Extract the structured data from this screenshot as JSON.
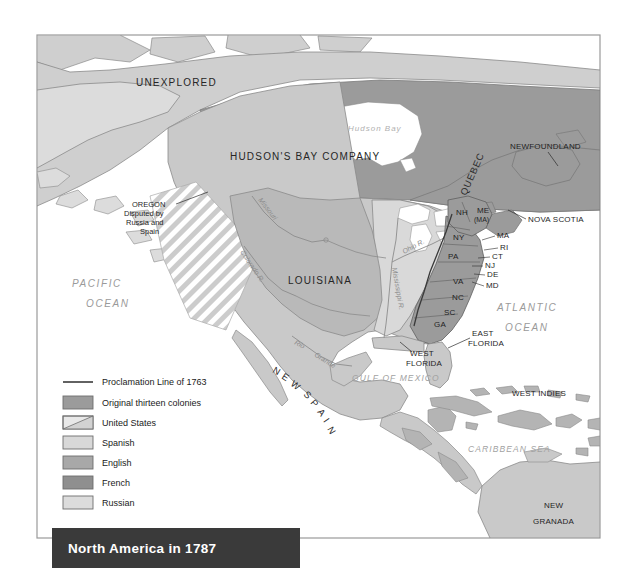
{
  "figure": {
    "title": "North America in 1787",
    "frame": {
      "x": 37,
      "y": 35,
      "width": 563,
      "height": 503
    }
  },
  "colors": {
    "ocean": "#ffffff",
    "page_background": "#ffffff",
    "frame_border": "#9a9a9a",
    "title_bar": "#3a3a3a",
    "title_text": "#ffffff",
    "thirteen_colonies": "#9b9b9b",
    "united_states": "#d9d9d9",
    "spanish": "#c9c9c9",
    "english": "#a8a8a8",
    "french": "#8f8f8f",
    "russian": "#dcdcdc",
    "unexplored": "#cfcfcf",
    "hudsons_bay": "#9b9b9b",
    "proclamation_line": "#3a3a3a",
    "coastline": "#8a8a8a",
    "river": "#8c8c8c"
  },
  "legend": {
    "items": [
      {
        "key": "proclamation-line",
        "label": "Proclamation Line of 1763",
        "swatch": "line",
        "color": "#3a3a3a"
      },
      {
        "key": "thirteen-colonies",
        "label": "Original thirteen colonies",
        "swatch": "solid",
        "color": "#9b9b9b"
      },
      {
        "key": "united-states",
        "label": "United States",
        "swatch": "diagonal",
        "color": "#b4b4b4"
      },
      {
        "key": "spanish",
        "label": "Spanish",
        "swatch": "solid",
        "color": "#c9c9c9"
      },
      {
        "key": "english",
        "label": "English",
        "swatch": "solid",
        "color": "#a8a8a8"
      },
      {
        "key": "french",
        "label": "French",
        "swatch": "solid",
        "color": "#8f8f8f"
      },
      {
        "key": "russian",
        "label": "Russian",
        "swatch": "solid",
        "color": "#dcdcdc"
      }
    ]
  },
  "regions": [
    {
      "key": "unexplored",
      "label": "UNEXPLORED"
    },
    {
      "key": "hudsons-bay-company",
      "label": "HUDSON'S BAY COMPANY"
    },
    {
      "key": "quebec",
      "label": "QUEBEC"
    },
    {
      "key": "newfoundland",
      "label": "NEWFOUNDLAND"
    },
    {
      "key": "nova-scotia",
      "label": "NOVA SCOTIA"
    },
    {
      "key": "louisiana",
      "label": "LOUISIANA"
    },
    {
      "key": "new-spain",
      "label": "NEW SPAIN"
    },
    {
      "key": "east-florida",
      "label": "EAST FLORIDA"
    },
    {
      "key": "west-florida",
      "label": "WEST FLORIDA"
    },
    {
      "key": "west-indies",
      "label": "WEST INDIES"
    },
    {
      "key": "new-granada",
      "label": "NEW GRANADA"
    }
  ],
  "region_labels": {
    "unexplored": "UNEXPLORED",
    "hudsons_bay_company": "HUDSON'S BAY COMPANY",
    "quebec": "QUEBEC",
    "newfoundland": "NEWFOUNDLAND",
    "nova_scotia": "NOVA SCOTIA",
    "louisiana": "LOUISIANA",
    "new_spain_letters": [
      "N",
      "E",
      "W",
      "S",
      "P",
      "A",
      "I",
      "N"
    ],
    "east_florida_line1": "EAST",
    "east_florida_line2": "FLORIDA",
    "west_florida_line1": "WEST",
    "west_florida_line2": "FLORIDA",
    "west_indies": "WEST  INDIES",
    "new_granada_line1": "NEW",
    "new_granada_line2": "GRANADA"
  },
  "annotations": {
    "oregon": {
      "line1": "OREGON",
      "line2": "Disputed by",
      "line3": "Russia and",
      "line4": "Spain"
    }
  },
  "water_labels": {
    "pacific_line1": "PACIFIC",
    "pacific_line2": "OCEAN",
    "atlantic_line1": "ATLANTIC",
    "atlantic_line2": "OCEAN",
    "hudson_bay": "Hudson  Bay",
    "gulf_of_mexico": "GULF OF MEXICO",
    "caribbean_sea": "CARIBBEAN SEA"
  },
  "rivers": [
    {
      "key": "missouri",
      "label": "Missouri"
    },
    {
      "key": "colorado",
      "label": "Colorado R."
    },
    {
      "key": "rio-grande-1",
      "label": "Rio"
    },
    {
      "key": "rio-grande-2",
      "label": "Grande"
    },
    {
      "key": "mississippi",
      "label": "Mississippi R."
    },
    {
      "key": "ohio",
      "label": "Ohio R."
    }
  ],
  "states": [
    {
      "key": "nh",
      "label": "NH"
    },
    {
      "key": "me",
      "label": "ME"
    },
    {
      "key": "ma-me",
      "label": "(MA)"
    },
    {
      "key": "ny",
      "label": "NY"
    },
    {
      "key": "ma",
      "label": "MA"
    },
    {
      "key": "ri",
      "label": "RI"
    },
    {
      "key": "ct",
      "label": "CT"
    },
    {
      "key": "pa",
      "label": "PA"
    },
    {
      "key": "nj",
      "label": "NJ"
    },
    {
      "key": "de",
      "label": "DE"
    },
    {
      "key": "md",
      "label": "MD"
    },
    {
      "key": "va",
      "label": "VA"
    },
    {
      "key": "nc",
      "label": "NC"
    },
    {
      "key": "sc",
      "label": "SC"
    },
    {
      "key": "ga",
      "label": "GA"
    }
  ]
}
